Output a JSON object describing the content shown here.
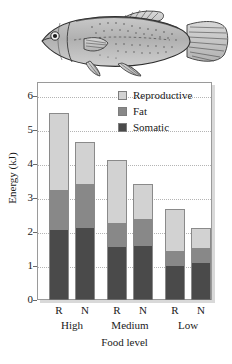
{
  "figure": {
    "illustration": {
      "name": "fish-illustration",
      "description": "grayscale line drawing of a killifish facing left"
    }
  },
  "chart_data": {
    "type": "bar",
    "stacked": true,
    "title": "",
    "xlabel": "Food level",
    "ylabel": "Energy (kJ)",
    "ylim": [
      0,
      6.4
    ],
    "yticks": [
      0,
      1,
      2,
      3,
      4,
      5,
      6
    ],
    "ytick_labels": [
      "0",
      "1",
      "2",
      "3",
      "4",
      "5",
      "6"
    ],
    "grid": true,
    "grid_style": "dotted horizontal",
    "legend_position": "top-right",
    "categories": [
      "R",
      "N",
      "R",
      "N",
      "R",
      "N"
    ],
    "groups": [
      {
        "label": "High",
        "members": [
          "R",
          "N"
        ]
      },
      {
        "label": "Medium",
        "members": [
          "R",
          "N"
        ]
      },
      {
        "label": "Low",
        "members": [
          "R",
          "N"
        ]
      }
    ],
    "series": [
      {
        "name": "Somatic",
        "color": "#4a4a4a",
        "values": [
          2.05,
          2.12,
          1.55,
          1.6,
          1.0,
          1.1
        ]
      },
      {
        "name": "Fat",
        "color": "#888888",
        "values": [
          1.17,
          1.28,
          0.71,
          0.78,
          0.45,
          0.43
        ]
      },
      {
        "name": "Reproductive",
        "color": "#d2d2d2",
        "values": [
          2.26,
          1.25,
          1.84,
          1.02,
          1.21,
          0.57
        ]
      }
    ],
    "totals": [
      5.48,
      4.65,
      4.1,
      3.4,
      2.66,
      2.1
    ],
    "legend": [
      {
        "label": "Reproductive",
        "color": "#d2d2d2"
      },
      {
        "label": "Fat",
        "color": "#888888"
      },
      {
        "label": "Somatic",
        "color": "#4a4a4a"
      }
    ]
  },
  "colors": {
    "reproductive": "#d2d2d2",
    "fat": "#888888",
    "somatic": "#4a4a4a",
    "axis": "#9a9a9a",
    "grid": "#b4b4b4",
    "text": "#1a1a1a"
  }
}
